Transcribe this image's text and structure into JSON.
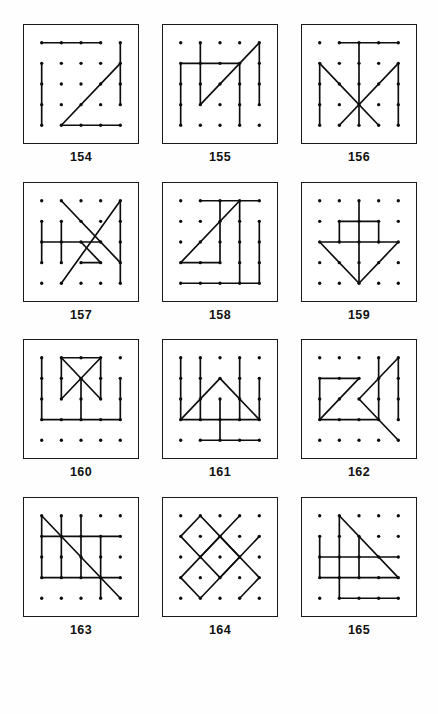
{
  "sheet": {
    "title": "Dot grid pattern puzzles 154-165",
    "grid": {
      "cols": 5,
      "rows": 5
    },
    "columns_per_row": 3,
    "ink_color": "#0d0d0d",
    "box_border_color": "#1a1a1a",
    "background_color": "#ffffff"
  },
  "panels": [
    {
      "label": "154",
      "dots": "5x5",
      "segments": [
        [
          0,
          0,
          3,
          0
        ],
        [
          0,
          1,
          0,
          4
        ],
        [
          1,
          4,
          4,
          4
        ],
        [
          4,
          0,
          4,
          3
        ],
        [
          1,
          4,
          4,
          1
        ]
      ]
    },
    {
      "label": "155",
      "dots": "5x5",
      "segments": [
        [
          0,
          1,
          3,
          1
        ],
        [
          0,
          1,
          0,
          4
        ],
        [
          1,
          0,
          1,
          3
        ],
        [
          3,
          1,
          3,
          4
        ],
        [
          4,
          0,
          4,
          3
        ],
        [
          1,
          3,
          4,
          0
        ]
      ]
    },
    {
      "label": "156",
      "dots": "5x5",
      "segments": [
        [
          1,
          0,
          4,
          0
        ],
        [
          2,
          0,
          2,
          4
        ],
        [
          0,
          1,
          0,
          4
        ],
        [
          4,
          1,
          4,
          4
        ],
        [
          0,
          1,
          3,
          4
        ],
        [
          4,
          1,
          1,
          4
        ]
      ]
    },
    {
      "label": "157",
      "dots": "5x5",
      "segments": [
        [
          0,
          1,
          0,
          3
        ],
        [
          1,
          1,
          1,
          3
        ],
        [
          0,
          2,
          3,
          2
        ],
        [
          4,
          0,
          4,
          4
        ],
        [
          1,
          0,
          4,
          3
        ],
        [
          4,
          0,
          1,
          4
        ],
        [
          2,
          2,
          3,
          3
        ],
        [
          3,
          3,
          2,
          3
        ]
      ]
    },
    {
      "label": "158",
      "dots": "5x5",
      "segments": [
        [
          1,
          0,
          4,
          0
        ],
        [
          0,
          3,
          3,
          0
        ],
        [
          0,
          3,
          2,
          3
        ],
        [
          2,
          0,
          2,
          3
        ],
        [
          3,
          0,
          3,
          4
        ],
        [
          0,
          4,
          4,
          4
        ],
        [
          4,
          1,
          4,
          4
        ]
      ]
    },
    {
      "label": "159",
      "dots": "5x5",
      "segments": [
        [
          1,
          1,
          3,
          1
        ],
        [
          1,
          1,
          1,
          2
        ],
        [
          3,
          1,
          3,
          2
        ],
        [
          0,
          2,
          4,
          2
        ],
        [
          2,
          0,
          2,
          4
        ],
        [
          0,
          2,
          2,
          4
        ],
        [
          2,
          4,
          4,
          2
        ]
      ]
    },
    {
      "label": "160",
      "dots": "5x5",
      "segments": [
        [
          0,
          0,
          0,
          3
        ],
        [
          1,
          0,
          3,
          0
        ],
        [
          1,
          0,
          1,
          2
        ],
        [
          3,
          0,
          3,
          2
        ],
        [
          1,
          0,
          3,
          2
        ],
        [
          3,
          0,
          1,
          2
        ],
        [
          2,
          1,
          2,
          3
        ],
        [
          0,
          3,
          4,
          3
        ],
        [
          4,
          1,
          4,
          3
        ]
      ]
    },
    {
      "label": "161",
      "dots": "5x5",
      "segments": [
        [
          0,
          0,
          0,
          3
        ],
        [
          1,
          0,
          1,
          3
        ],
        [
          3,
          0,
          3,
          3
        ],
        [
          4,
          1,
          4,
          3
        ],
        [
          0,
          3,
          4,
          3
        ],
        [
          0,
          3,
          2,
          1
        ],
        [
          2,
          1,
          4,
          3
        ],
        [
          2,
          2,
          2,
          4
        ],
        [
          1,
          4,
          4,
          4
        ]
      ]
    },
    {
      "label": "162",
      "dots": "5x5",
      "segments": [
        [
          0,
          1,
          2,
          1
        ],
        [
          0,
          1,
          0,
          3
        ],
        [
          0,
          3,
          3,
          3
        ],
        [
          0,
          3,
          2,
          1
        ],
        [
          3,
          0,
          3,
          3
        ],
        [
          4,
          0,
          2,
          2
        ],
        [
          2,
          2,
          4,
          4
        ],
        [
          4,
          0,
          4,
          3
        ]
      ]
    },
    {
      "label": "163",
      "dots": "5x5",
      "segments": [
        [
          0,
          0,
          0,
          3
        ],
        [
          1,
          0,
          1,
          3
        ],
        [
          2,
          0,
          2,
          3
        ],
        [
          3,
          1,
          3,
          4
        ],
        [
          0,
          1,
          4,
          1
        ],
        [
          0,
          3,
          4,
          3
        ],
        [
          0,
          0,
          4,
          4
        ]
      ]
    },
    {
      "label": "164",
      "dots": "5x5",
      "segments": [
        [
          1,
          0,
          0,
          1
        ],
        [
          0,
          1,
          1,
          2
        ],
        [
          1,
          2,
          2,
          1
        ],
        [
          2,
          1,
          1,
          0
        ],
        [
          1,
          2,
          2,
          3
        ],
        [
          2,
          3,
          3,
          2
        ],
        [
          3,
          2,
          2,
          1
        ],
        [
          3,
          0,
          0,
          3
        ],
        [
          0,
          3,
          1,
          4
        ],
        [
          1,
          4,
          4,
          1
        ],
        [
          2,
          1,
          4,
          3
        ],
        [
          4,
          3,
          3,
          4
        ]
      ]
    },
    {
      "label": "165",
      "dots": "5x5",
      "segments": [
        [
          1,
          0,
          1,
          4
        ],
        [
          1,
          0,
          4,
          3
        ],
        [
          0,
          1,
          0,
          3
        ],
        [
          2,
          1,
          2,
          3
        ],
        [
          0,
          2,
          4,
          2
        ],
        [
          0,
          3,
          4,
          3
        ],
        [
          1,
          4,
          4,
          4
        ]
      ]
    }
  ]
}
